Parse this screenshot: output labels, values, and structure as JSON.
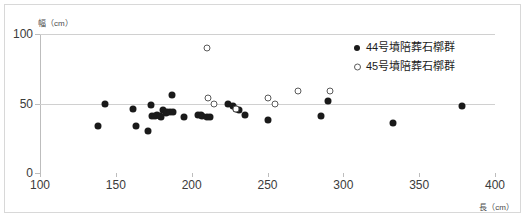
{
  "chart_data": {
    "type": "scatter",
    "title": "",
    "xlabel": "長（cm）",
    "ylabel": "幅（cm）",
    "xlim": [
      100,
      400
    ],
    "ylim": [
      0,
      100
    ],
    "xticks": [
      100,
      150,
      200,
      250,
      300,
      350,
      400
    ],
    "yticks": [
      0,
      50,
      100
    ],
    "grid": "horizontal",
    "legend_position": "upper-right-inside",
    "series": [
      {
        "name": "44号墳陪葬石槨群",
        "marker": "filled-circle",
        "color": "#1a1a1a",
        "points": [
          [
            138,
            34
          ],
          [
            143,
            50
          ],
          [
            161,
            46
          ],
          [
            163,
            34
          ],
          [
            171,
            30
          ],
          [
            173,
            49
          ],
          [
            174,
            41
          ],
          [
            176,
            41
          ],
          [
            177,
            42
          ],
          [
            179,
            41
          ],
          [
            180,
            40
          ],
          [
            181,
            45
          ],
          [
            183,
            43
          ],
          [
            184,
            44
          ],
          [
            186,
            44
          ],
          [
            187,
            56
          ],
          [
            188,
            44
          ],
          [
            195,
            40
          ],
          [
            204,
            42
          ],
          [
            206,
            42
          ],
          [
            207,
            41
          ],
          [
            210,
            40
          ],
          [
            212,
            40
          ],
          [
            224,
            50
          ],
          [
            227,
            48
          ],
          [
            229,
            46
          ],
          [
            231,
            45
          ],
          [
            235,
            42
          ],
          [
            250,
            38
          ],
          [
            285,
            41
          ],
          [
            290,
            52
          ],
          [
            333,
            36
          ],
          [
            378,
            48
          ]
        ]
      },
      {
        "name": "45号墳陪葬石槨群",
        "marker": "open-circle",
        "color": "#5a5a5a",
        "points": [
          [
            210,
            90
          ],
          [
            211,
            54
          ],
          [
            215,
            50
          ],
          [
            229,
            46
          ],
          [
            250,
            54
          ],
          [
            255,
            50
          ],
          [
            270,
            59
          ],
          [
            291,
            59
          ]
        ]
      }
    ]
  },
  "axis": {
    "y_tick_labels": [
      "100",
      "50",
      "0"
    ],
    "x_tick_labels": [
      "100",
      "150",
      "200",
      "250",
      "300",
      "350",
      "400"
    ]
  },
  "legend": {
    "items": [
      {
        "label": "44号墳陪葬石槨群"
      },
      {
        "label": "45号墳陪葬石槨群"
      }
    ]
  }
}
